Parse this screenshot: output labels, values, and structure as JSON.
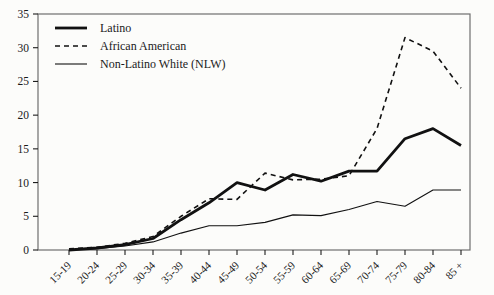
{
  "figure": {
    "background": "#fcfcfa",
    "box_border_color": "#6e6e6e",
    "axis_color": "#1c1c1c",
    "line_color": "#111111"
  },
  "chart_data": {
    "type": "line",
    "title": "",
    "xlabel": "",
    "ylabel": "",
    "ylim": [
      0,
      35
    ],
    "y_ticks": [
      0,
      5,
      10,
      15,
      20,
      25,
      30,
      35
    ],
    "grid": "off",
    "legend_position": "top-left-inside",
    "categories": [
      "15-19",
      "20-24",
      "25-29",
      "30-34",
      "35-39",
      "40-44",
      "45-49",
      "50-54",
      "55-59",
      "60-64",
      "65-69",
      "70-74",
      "75-79",
      "80-84",
      "85 +"
    ],
    "series": [
      {
        "name": "Latino",
        "style": "solid-thick",
        "stroke_width": 2.8,
        "dash": "",
        "values": [
          0,
          0.3,
          0.8,
          1.7,
          4.5,
          7.0,
          10.0,
          8.9,
          11.2,
          10.2,
          11.7,
          11.7,
          16.5,
          18.0,
          15.5
        ]
      },
      {
        "name": "African American",
        "style": "dashed",
        "stroke_width": 1.6,
        "dash": "5 4",
        "values": [
          0.2,
          0.4,
          1.0,
          2.0,
          5.0,
          7.6,
          7.5,
          11.4,
          10.4,
          10.5,
          11.0,
          18.0,
          31.5,
          29.5,
          24.0
        ]
      },
      {
        "name": "Non-Latino White (NLW)",
        "style": "solid-thin",
        "stroke_width": 1.1,
        "dash": "",
        "values": [
          0,
          0.2,
          0.6,
          1.2,
          2.5,
          3.6,
          3.6,
          4.1,
          5.2,
          5.1,
          6.0,
          7.2,
          6.5,
          8.9,
          8.9
        ]
      }
    ]
  }
}
